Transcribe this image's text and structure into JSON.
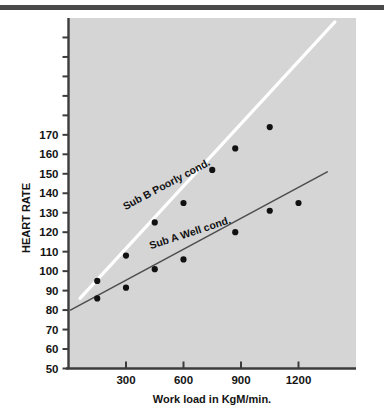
{
  "figure": {
    "background_color": "#ffffff",
    "plot_background_color": "#d5d5d5",
    "top_rule_color": "#4a4a4a"
  },
  "chart_data": {
    "type": "scatter",
    "title": "",
    "subtitle": "",
    "xlabel": "Work load in KgM/min.",
    "ylabel": "HEART RATE",
    "xlim": [
      0,
      1500
    ],
    "ylim": [
      50,
      230
    ],
    "grid": false,
    "legend_position": "inline-annotation",
    "xticks": [
      300,
      600,
      900,
      1200
    ],
    "xtick_labels": [
      "300",
      "600",
      "900",
      "1200"
    ],
    "yticks": [
      50,
      60,
      70,
      80,
      90,
      100,
      110,
      120,
      130,
      140,
      150,
      160,
      170,
      180,
      190,
      200,
      210,
      220
    ],
    "ytick_labels": [
      "50",
      "60",
      "70",
      "80",
      "90",
      "100",
      "110",
      "120",
      "130",
      "140",
      "150",
      "160",
      "170",
      "",
      "",
      "",
      "",
      ""
    ],
    "annotations": [
      {
        "text": "Sub B  Poorly cond.",
        "x": 520,
        "y": 143,
        "rotation": -28
      },
      {
        "text": "Sub A  Well cond.",
        "x": 640,
        "y": 118,
        "rotation": -18
      }
    ],
    "series": [
      {
        "name": "Sub B  Poorly cond.",
        "line_color": "#ffffff",
        "marker_color": "#111111",
        "line_width": 3.2,
        "x": [
          150,
          300,
          450,
          600,
          750,
          870,
          1050
        ],
        "y": [
          95,
          108,
          125,
          135,
          152,
          163,
          174
        ],
        "fit_x": [
          60,
          1390
        ],
        "fit_y": [
          86,
          228
        ]
      },
      {
        "name": "Sub A  Well cond.",
        "line_color": "#4d4d4d",
        "marker_color": "#111111",
        "line_width": 1.5,
        "x": [
          150,
          300,
          450,
          600,
          870,
          1050,
          1200
        ],
        "y": [
          86,
          91.5,
          101,
          106,
          120,
          131,
          135
        ],
        "fit_x": [
          10,
          1350
        ],
        "fit_y": [
          80,
          151
        ]
      }
    ]
  }
}
